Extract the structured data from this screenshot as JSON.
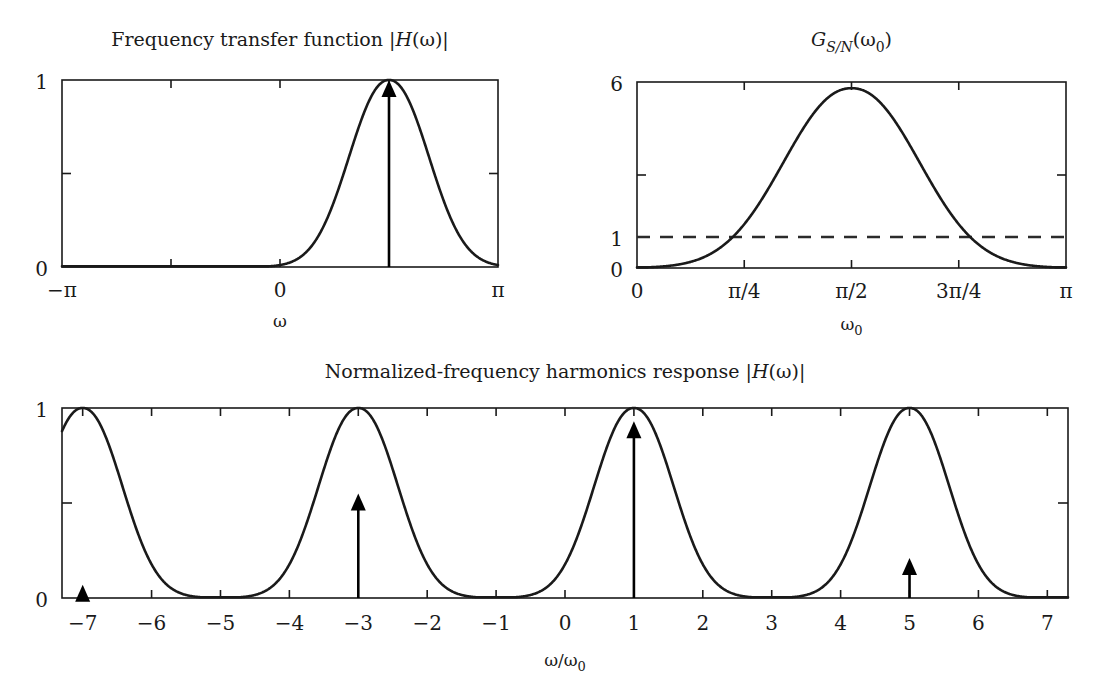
{
  "figure": {
    "background": "#ffffff",
    "ink_color": "#1a1a1a",
    "width": 1116,
    "height": 694
  },
  "panels": {
    "top_left": {
      "title": "Frequency transfer function |H(ω)|",
      "title_plain": "Frequency transfer function",
      "title_math": "|H(ω)|",
      "xlabel": "ω",
      "x_ticks": [
        "−π",
        "0",
        "π"
      ],
      "y_ticks": [
        "1",
        "0"
      ]
    },
    "top_right": {
      "title": "G_{S/N}(ω₀)",
      "title_main": "G",
      "title_sub": "S/N",
      "title_arg": "(ω",
      "title_arg_sub": "0",
      "title_arg_close": ")",
      "xlabel": "ω₀",
      "xlabel_main": "ω",
      "xlabel_sub": "0",
      "x_ticks": [
        "0",
        "π/4",
        "π/2",
        "3π/4",
        "π"
      ],
      "y_ticks": [
        "6",
        "1",
        "0"
      ]
    },
    "bottom": {
      "title": "Normalized-frequency harmonics response |H(ω)|",
      "title_plain": "Normalized-frequency harmonics response",
      "title_math": "|H(ω)|",
      "xlabel": "ω/ω₀",
      "xlabel_main": "ω/ω",
      "xlabel_sub": "0",
      "x_ticks": [
        "−7",
        "−6",
        "−5",
        "−4",
        "−3",
        "−2",
        "−1",
        "0",
        "1",
        "2",
        "3",
        "4",
        "5",
        "6",
        "7"
      ],
      "y_ticks": [
        "1",
        "0"
      ]
    }
  },
  "chart_data": [
    {
      "id": "frequency-transfer-function",
      "type": "line",
      "title": "Frequency transfer function |H(ω)|",
      "xlabel": "ω",
      "ylabel": "",
      "xlim": [
        -3.141592653589793,
        3.141592653589793
      ],
      "ylim": [
        0,
        1
      ],
      "xtick_values": [
        -3.141592653589793,
        0,
        3.141592653589793
      ],
      "xtick_labels": [
        "−π",
        "0",
        "π"
      ],
      "ytick_values": [
        0,
        1
      ],
      "ytick_labels": [
        "0",
        "1"
      ],
      "grid": false,
      "legend": "none",
      "curve_model": {
        "description": "Narrow-band resonator magnitude response |H(ω)| peaking at ω0 = π/2",
        "form": "gaussian-like lobe centered at pi/2",
        "center": 1.5707963267948966,
        "peak": 1.0,
        "half_width": 0.95
      },
      "annotations": [
        {
          "kind": "arrow",
          "x": 1.5707963267948966,
          "y0": 0.0,
          "y1": 1.0,
          "label": "ω0 harmonic"
        }
      ]
    },
    {
      "id": "signal-to-noise-gain",
      "type": "line",
      "title": "G_{S/N}(ω₀)",
      "xlabel": "ω₀",
      "ylabel": "",
      "xlim": [
        0,
        3.141592653589793
      ],
      "ylim": [
        0,
        6
      ],
      "xtick_values": [
        0,
        0.7853981633974483,
        1.5707963267948966,
        2.356194490192345,
        3.141592653589793
      ],
      "xtick_labels": [
        "0",
        "π/4",
        "π/2",
        "3π/4",
        "π"
      ],
      "ytick_values": [
        0,
        1,
        3,
        6
      ],
      "ytick_labels": [
        "0",
        "1",
        "",
        "6"
      ],
      "grid": false,
      "legend": "none",
      "curve_model": {
        "description": "S/N gain versus fundamental frequency, peaks 5.8 at pi/2, unity crossings near pi/4 and 3pi/4",
        "center": 1.5707963267948966,
        "peak": 5.8,
        "half_width": 0.82
      },
      "reference_lines": [
        {
          "kind": "horizontal",
          "y": 1,
          "style": "dashed",
          "label": "unity gain"
        }
      ],
      "sampled_points": [
        {
          "x": 0.0,
          "y": 0.0
        },
        {
          "x": 0.3926990816987241,
          "y": 0.12
        },
        {
          "x": 0.5890486225480862,
          "y": 0.55
        },
        {
          "x": 0.7853981633974483,
          "y": 1.0
        },
        {
          "x": 0.9817477042468103,
          "y": 2.2
        },
        {
          "x": 1.1780972450961724,
          "y": 3.8
        },
        {
          "x": 1.3744467859455345,
          "y": 5.3
        },
        {
          "x": 1.5707963267948966,
          "y": 5.8
        },
        {
          "x": 1.7671458676442586,
          "y": 5.3
        },
        {
          "x": 1.9634954084936207,
          "y": 3.8
        },
        {
          "x": 2.1598449493429825,
          "y": 2.2
        },
        {
          "x": 2.356194490192345,
          "y": 1.0
        },
        {
          "x": 2.552544031041707,
          "y": 0.55
        },
        {
          "x": 2.748893571891069,
          "y": 0.12
        },
        {
          "x": 3.141592653589793,
          "y": 0.0
        }
      ]
    },
    {
      "id": "normalized-frequency-harmonics-response",
      "type": "line",
      "title": "Normalized-frequency harmonics response |H(ω)|",
      "xlabel": "ω/ω₀",
      "ylabel": "",
      "xlim": [
        -7.3,
        7.3
      ],
      "ylim": [
        0,
        1
      ],
      "xtick_values": [
        -7,
        -6,
        -5,
        -4,
        -3,
        -2,
        -1,
        0,
        1,
        2,
        3,
        4,
        5,
        6,
        7
      ],
      "xtick_labels": [
        "−7",
        "−6",
        "−5",
        "−4",
        "−3",
        "−2",
        "−1",
        "0",
        "1",
        "2",
        "3",
        "4",
        "5",
        "6",
        "7"
      ],
      "ytick_values": [
        0,
        1
      ],
      "ytick_labels": [
        "0",
        "1"
      ],
      "grid": false,
      "legend": "none",
      "curve_model": {
        "description": "Periodic passband lobes of the comb-like response, lobes centered at normalized frequencies -7, -3, 1, 5",
        "lobe_centers": [
          -7,
          -3,
          1,
          5
        ],
        "lobe_peak": 1.0,
        "lobe_half_width": 0.95,
        "period": 4
      },
      "annotations": [
        {
          "kind": "arrow",
          "x": -7,
          "y0": 0.0,
          "y1": 0.07,
          "label": "harmonic at -7"
        },
        {
          "kind": "arrow",
          "x": -3,
          "y0": 0.0,
          "y1": 0.55,
          "label": "harmonic at -3"
        },
        {
          "kind": "arrow",
          "x": 1,
          "y0": 0.0,
          "y1": 0.93,
          "label": "harmonic at 1"
        },
        {
          "kind": "arrow",
          "x": 5,
          "y0": 0.0,
          "y1": 0.21,
          "label": "harmonic at 5"
        }
      ]
    }
  ]
}
